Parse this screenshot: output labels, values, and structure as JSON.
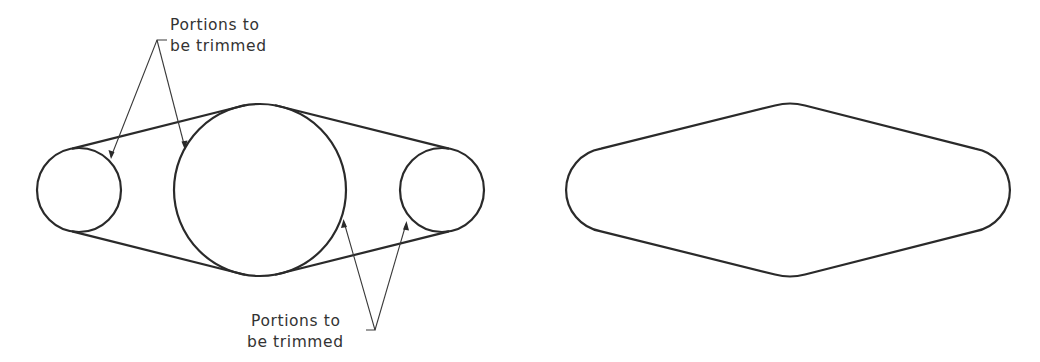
{
  "figure": {
    "left_view": {
      "description": "Three circles connected by tangent lines before trimming",
      "circles": [
        {
          "name": "left-small-circle",
          "cx": 79,
          "cy": 190,
          "r": 42
        },
        {
          "name": "center-large-circle",
          "cx": 260,
          "cy": 190,
          "r": 86
        },
        {
          "name": "right-small-circle",
          "cx": 442,
          "cy": 190,
          "r": 42
        }
      ],
      "callouts": [
        {
          "line1": "Portions to",
          "line2": "be trimmed",
          "position": "top"
        },
        {
          "line1": "Portions to",
          "line2": "be trimmed",
          "position": "bottom"
        }
      ]
    },
    "right_view": {
      "description": "Resulting trimmed outline"
    }
  }
}
